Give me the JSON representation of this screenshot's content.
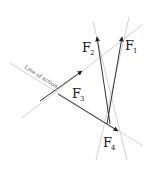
{
  "diagram": {
    "line_of_action_label": "Line of action",
    "forces": [
      {
        "id": "F1",
        "letter": "F",
        "sub": "1"
      },
      {
        "id": "F2",
        "letter": "F",
        "sub": "2"
      },
      {
        "id": "F3",
        "letter": "F",
        "sub": "3"
      },
      {
        "id": "F4",
        "letter": "F",
        "sub": "4"
      }
    ],
    "colors": {
      "guide_line": "#bdbdbd",
      "arrow": "#333333"
    }
  }
}
